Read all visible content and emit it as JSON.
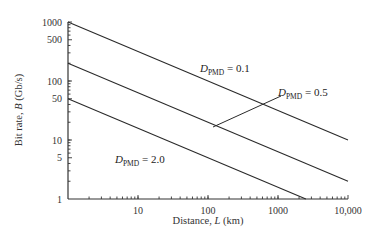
{
  "chart_data": {
    "type": "line",
    "title": "",
    "xlabel": "Distance, L (km)",
    "ylabel": "Bit rate, B (Gb/s)",
    "xscale": "log",
    "yscale": "log",
    "xlim": [
      1,
      10000
    ],
    "ylim": [
      1,
      1000
    ],
    "x_tick_labels": [
      "10",
      "100",
      "1000",
      "10,000"
    ],
    "x_ticks": [
      10,
      100,
      1000,
      10000
    ],
    "y_tick_labels": [
      "1",
      "5",
      "10",
      "50",
      "100",
      "500",
      "1000"
    ],
    "y_ticks": [
      1,
      5,
      10,
      50,
      100,
      500,
      1000
    ],
    "grid": false,
    "legend": "inline labels",
    "series": [
      {
        "name": "D_PMD = 0.1",
        "label_main": "D",
        "label_sub": "PMD",
        "label_value": " = 0.1",
        "x": [
          1,
          10000
        ],
        "y": [
          1000,
          10
        ]
      },
      {
        "name": "D_PMD = 0.5",
        "label_main": "D",
        "label_sub": "PMD",
        "label_value": " = 0.5",
        "x": [
          1,
          10000
        ],
        "y": [
          200,
          2
        ]
      },
      {
        "name": "D_PMD = 2.0",
        "label_main": "D",
        "label_sub": "PMD",
        "label_value": " = 2.0",
        "x": [
          1,
          2500
        ],
        "y": [
          50,
          1
        ]
      }
    ]
  }
}
